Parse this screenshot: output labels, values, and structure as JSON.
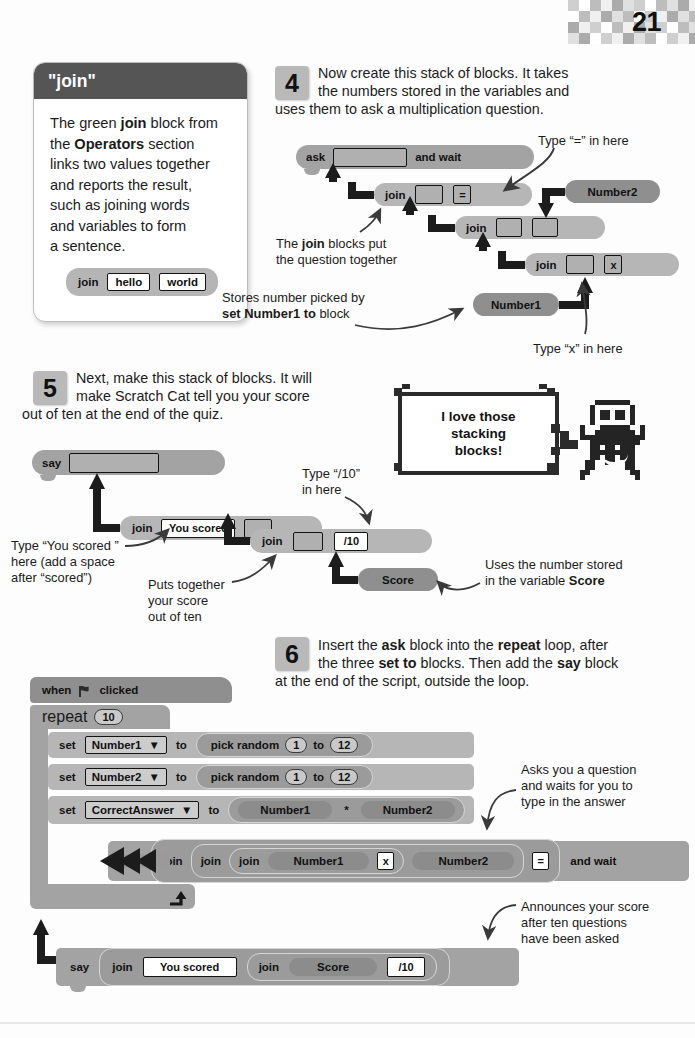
{
  "page": {
    "number": "21"
  },
  "panel": {
    "title": "\"join\"",
    "body_parts": [
      "The green ",
      "join",
      " block from",
      "the ",
      "Operators",
      " section",
      "links two values together",
      "and reports the result,",
      "such as joining words",
      "and variables to form",
      "a sentence."
    ],
    "demo_block": {
      "label": "join",
      "field1": "hello",
      "field2": "world"
    }
  },
  "step4": {
    "number": "4",
    "text": "Now create this stack of blocks. It takes the numbers stored in the variables and uses them to ask a multiplication question.",
    "line1": "Now create this stack of blocks. It takes",
    "line2": "the numbers stored in the variables and",
    "line3": "uses them to ask a multiplication question.",
    "blocks": {
      "ask": {
        "label": "ask",
        "and_wait": "and wait",
        "slot": ""
      },
      "join_top": {
        "label": "join",
        "slot1": "",
        "slot2": "="
      },
      "join_mid": {
        "label": "join",
        "slot1": "",
        "slot2": ""
      },
      "join_bot": {
        "label": "join",
        "slot1": "",
        "slot2": "x"
      },
      "number1": "Number1",
      "number2": "Number2"
    },
    "annotations": {
      "type_equals": "Type “=” in here",
      "join_blocks_l1": "The ",
      "join_blocks_b": "join",
      "join_blocks_l1b": " blocks put",
      "join_blocks_l2": "the question together",
      "stores_l1": "Stores number picked by",
      "stores_b": "set Number1 to",
      "stores_l2b": " block",
      "type_x": "Type “x” in here"
    }
  },
  "step5": {
    "number": "5",
    "line1": "Next, make this stack of blocks. It will",
    "line2": "make Scratch Cat tell you your score",
    "line3": "out of ten at the end of the quiz.",
    "blocks": {
      "say": {
        "label": "say",
        "slot": ""
      },
      "join_top": {
        "label": "join",
        "field1": "You scored",
        "slot2": ""
      },
      "join_bot": {
        "label": "join",
        "slot1": "",
        "field2": "/10"
      },
      "score": "Score"
    },
    "annotations": {
      "type_slash10_l1": "Type “/10”",
      "type_slash10_l2": "in here",
      "type_youscored_l1": "Type “You scored ”",
      "type_youscored_l2": "here (add a space",
      "type_youscored_l3": "after “scored”)",
      "puts_l1": "Puts together",
      "puts_l2": "your score",
      "puts_l3": "out of ten",
      "uses_l1": "Uses the number stored",
      "uses_l2a": "in the variable ",
      "uses_l2b": "Score"
    },
    "bubble": {
      "line1": "I love those",
      "line2": "stacking",
      "line3": "blocks!"
    }
  },
  "step6": {
    "number": "6",
    "line1a": "Insert the ",
    "line1b": "ask",
    "line1c": " block into the ",
    "line1d": "repeat",
    "line1e": " loop, after",
    "line2a": "the three ",
    "line2b": "set to",
    "line2c": " blocks. Then add the ",
    "line2d": "say",
    "line2e": " block",
    "line3": "at the end of the script, outside the loop.",
    "script": {
      "hat": {
        "when": "when",
        "flag_icon": "green-flag-icon",
        "clicked": "clicked"
      },
      "repeat": {
        "label": "repeat",
        "times": "10"
      },
      "set1": {
        "set": "set",
        "var": "Number1",
        "to": "to",
        "op": "pick random",
        "from": "1",
        "mid": "to",
        "until": "12"
      },
      "set2": {
        "set": "set",
        "var": "Number2",
        "to": "to",
        "op": "pick random",
        "from": "1",
        "mid": "to",
        "until": "12"
      },
      "set3": {
        "set": "set",
        "var": "CorrectAnswer",
        "to": "to",
        "a": "Number1",
        "op": "*",
        "b": "Number2"
      },
      "ask": {
        "label": "ask",
        "join1": "join",
        "join2": "join",
        "join3": "join",
        "number1": "Number1",
        "times": "x",
        "number2": "Number2",
        "equals": "=",
        "and_wait": "and wait"
      },
      "say": {
        "label": "say",
        "join1": "join",
        "you_scored": "You scored",
        "join2": "join",
        "score": "Score",
        "slash10": "/10"
      }
    },
    "annotations": {
      "asks_l1": "Asks you a question",
      "asks_l2": "and waits for you to",
      "asks_l3": "type in the answer",
      "ann_l1": "Announces your score",
      "ann_l2": "after ten questions",
      "ann_l3": "have been asked"
    }
  },
  "colors": {
    "panel_header": "#555555",
    "block_grey": "#a3a3a3",
    "accent_dark": "#2b2b2b"
  }
}
